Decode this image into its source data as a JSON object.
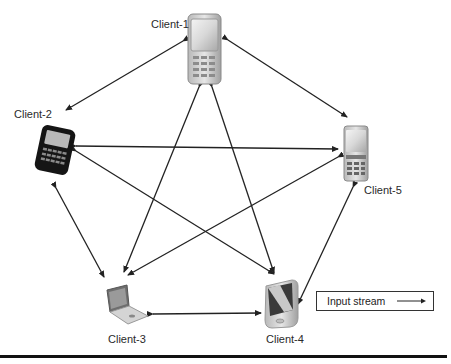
{
  "diagram": {
    "nodes": [
      {
        "id": "client-1",
        "label": "Client-1",
        "device": "mobile-phone-icon"
      },
      {
        "id": "client-2",
        "label": "Client-2",
        "device": "blackberry-phone-icon"
      },
      {
        "id": "client-3",
        "label": "Client-3",
        "device": "laptop-icon"
      },
      {
        "id": "client-4",
        "label": "Client-4",
        "device": "pda-icon"
      },
      {
        "id": "client-5",
        "label": "Client-5",
        "device": "mobile-phone-icon"
      }
    ],
    "edges": [
      {
        "from": "client-1",
        "to": "client-2",
        "bidirectional": true
      },
      {
        "from": "client-1",
        "to": "client-5",
        "bidirectional": true
      },
      {
        "from": "client-1",
        "to": "client-3",
        "bidirectional": true
      },
      {
        "from": "client-1",
        "to": "client-4",
        "bidirectional": true
      },
      {
        "from": "client-2",
        "to": "client-5",
        "bidirectional": true
      },
      {
        "from": "client-2",
        "to": "client-3",
        "bidirectional": true
      },
      {
        "from": "client-2",
        "to": "client-4",
        "bidirectional": true
      },
      {
        "from": "client-5",
        "to": "client-3",
        "bidirectional": true
      },
      {
        "from": "client-5",
        "to": "client-4",
        "bidirectional": true
      },
      {
        "from": "client-3",
        "to": "client-4",
        "bidirectional": true
      }
    ],
    "legend": {
      "label": "Input stream",
      "symbol": "arrow-right"
    }
  }
}
